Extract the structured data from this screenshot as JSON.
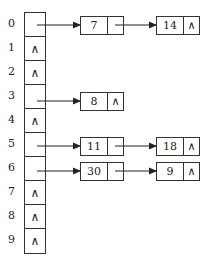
{
  "diagram": {
    "type": "hash-table-chaining",
    "null_symbol": "∧",
    "buckets": [
      {
        "index": "0",
        "chain": [
          "7",
          "14"
        ]
      },
      {
        "index": "1",
        "chain": []
      },
      {
        "index": "2",
        "chain": []
      },
      {
        "index": "3",
        "chain": [
          "8"
        ]
      },
      {
        "index": "4",
        "chain": []
      },
      {
        "index": "5",
        "chain": [
          "11",
          "18"
        ]
      },
      {
        "index": "6",
        "chain": [
          "30",
          "9"
        ]
      },
      {
        "index": "7",
        "chain": []
      },
      {
        "index": "8",
        "chain": []
      },
      {
        "index": "9",
        "chain": []
      }
    ]
  },
  "labels": {
    "i0": "0",
    "i1": "1",
    "i2": "2",
    "i3": "3",
    "i4": "4",
    "i5": "5",
    "i6": "6",
    "i7": "7",
    "i8": "8",
    "i9": "9"
  },
  "cells": {
    "c1": "∧",
    "c2": "∧",
    "c4": "∧",
    "c7": "∧",
    "c8": "∧",
    "c9": "∧"
  },
  "nodes": {
    "b0n0": {
      "val": "7",
      "ptr": ""
    },
    "b0n1": {
      "val": "14",
      "ptr": "∧"
    },
    "b3n0": {
      "val": "8",
      "ptr": "∧"
    },
    "b5n0": {
      "val": "11",
      "ptr": ""
    },
    "b5n1": {
      "val": "18",
      "ptr": "∧"
    },
    "b6n0": {
      "val": "30",
      "ptr": ""
    },
    "b6n1": {
      "val": "9",
      "ptr": "∧"
    }
  }
}
